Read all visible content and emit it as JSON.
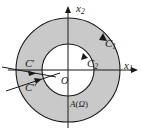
{
  "figure": {
    "kind": "annulus-contour-diagram",
    "background_color": "#ffffff",
    "region_fill_color": "#c9c9c9",
    "curve_color": "#1a1a1a",
    "axis_color": "#1a1a1a",
    "labels": {
      "x_axis": "x",
      "x_axis_sub": "1",
      "y_axis": "x",
      "y_axis_sub": "2",
      "origin": "O",
      "outer_contour": "C",
      "outer_contour_sub": "1",
      "inner_contour": "C",
      "inner_contour_sub": "2",
      "cut_upper": "C",
      "cut_upper_prime": "′",
      "cut_lower": "C",
      "cut_lower_prime": "″",
      "region": "A",
      "region_open_paren": "(",
      "region_symbol": "Ω",
      "region_close_paren": ")"
    },
    "geometry": {
      "center_x": 68,
      "center_y": 70,
      "outer_radius": 52,
      "inner_radius": 26,
      "axis_x_start": 8,
      "axis_x_end": 136,
      "axis_y_start": 128,
      "axis_y_end": 6
    },
    "orientations": {
      "outer_contour": "counterclockwise",
      "inner_contour": "clockwise",
      "cut_upper": "rightward-inward",
      "cut_lower": "rightward-inward"
    }
  }
}
